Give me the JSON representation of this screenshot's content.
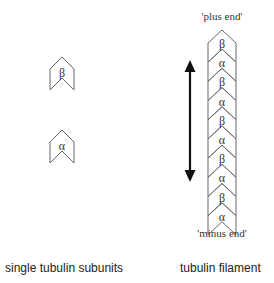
{
  "diagram": {
    "left_panel": {
      "caption": "single tubulin subunits",
      "subunits": [
        {
          "label": "β",
          "x": 62,
          "y_top": 57
        },
        {
          "label": "α",
          "x": 62,
          "y_top": 130
        }
      ]
    },
    "right_panel": {
      "caption": "tubulin filament",
      "plus_end_label": "'plus end'",
      "minus_end_label": "'minus end'",
      "filament_segments": [
        "β",
        "α",
        "β",
        "α",
        "β",
        "α",
        "β",
        "α",
        "β",
        "α"
      ],
      "arrow": {
        "type": "double-headed",
        "orientation": "vertical"
      }
    },
    "colors": {
      "outline": "#666666",
      "text": "#333333",
      "arrow": "#111111"
    }
  }
}
